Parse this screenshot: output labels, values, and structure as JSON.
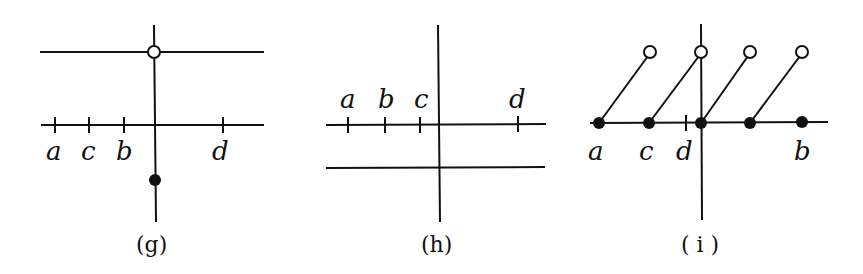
{
  "figure": {
    "panels": [
      {
        "id": "g",
        "caption": "(g)",
        "labels": {
          "a": "a",
          "c": "c",
          "b": "b",
          "d": "d"
        },
        "label_order_left_to_right": [
          "a",
          "c",
          "b",
          "d"
        ],
        "elements": [
          "upper horizontal line with open circle at vertical",
          "number line with ticks a, c, b, d",
          "vertical line",
          "filled dot below axis on vertical"
        ]
      },
      {
        "id": "h",
        "caption": "(h)",
        "labels": {
          "a": "a",
          "b": "b",
          "c": "c",
          "d": "d"
        },
        "label_order_left_to_right": [
          "a",
          "b",
          "c",
          "d"
        ],
        "elements": [
          "number line with ticks a, b, c, d (labels above)",
          "lower horizontal line",
          "vertical line"
        ]
      },
      {
        "id": "i",
        "caption": "( i )",
        "labels": {
          "a": "a",
          "c": "c",
          "d": "d",
          "b": "b"
        },
        "label_order_left_to_right": [
          "a",
          "c",
          "d",
          "b"
        ],
        "elements": [
          "number line with filled dots",
          "four diagonal segments ending in open circles",
          "tick at d",
          "vertical line"
        ]
      }
    ]
  }
}
